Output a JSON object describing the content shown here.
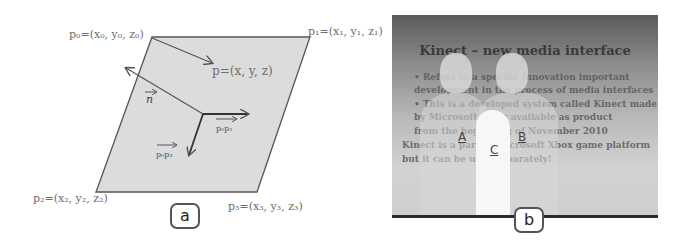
{
  "panel_a": {
    "badge": "a",
    "points": {
      "p0": "p₀=(x₀, y₀, z₀)",
      "p1": "p₁=(x₁, y₁, z₁)",
      "p2": "p₂=(x₂, y₂, z₂)",
      "p3": "p₃=(x₃, y₃, z₃)",
      "p": "p=(x, y, z)"
    },
    "vectors": {
      "n": "n",
      "p0p1": "p₀p₁",
      "p0p2": "p₀p₂"
    },
    "colors": {
      "plane_fill": "#dcdcdc",
      "stroke": "#555555"
    }
  },
  "panel_b": {
    "badge": "b",
    "slide": {
      "title": "Kinect – new media interface",
      "lines": [
        "• Refers to a specific innovation important",
        "  development in the process of media interfaces",
        "• This is a developed system called Kinect made",
        "  by Microsoft, later available as product",
        "  from the beginning of November 2010",
        "Kinect is a part of Microsoft Xbox game platform",
        "but it can be used separately!"
      ]
    },
    "people": [
      "A",
      "B",
      "C"
    ]
  }
}
